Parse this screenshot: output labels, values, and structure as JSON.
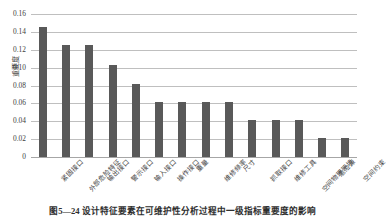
{
  "chart_data": {
    "type": "bar",
    "title": "",
    "xlabel": "",
    "ylabel": "重要度",
    "ylim": [
      0,
      0.16
    ],
    "ytick_labels": [
      "0.16",
      "0.14",
      "0.12",
      "0.10",
      "0.08",
      "0.06",
      "0.04",
      "0.02",
      "0"
    ],
    "ytick_values": [
      0.16,
      0.14,
      0.12,
      0.1,
      0.08,
      0.06,
      0.04,
      0.02,
      0
    ],
    "grid": true,
    "legend": "none",
    "bar_color": "#595959",
    "gridline_color": "#bfbfbf",
    "categories": [
      "紧固接口",
      "外部危险特征",
      "输出接口",
      "警示接口",
      "输入接口",
      "操作接口",
      "重量",
      "维修频率",
      "尺寸",
      "抓取接口",
      "维修工具",
      "空间物理环境",
      "危险源",
      "空间约束"
    ],
    "values": [
      0.146,
      0.125,
      0.125,
      0.103,
      0.082,
      0.062,
      0.062,
      0.062,
      0.062,
      0.041,
      0.041,
      0.041,
      0.021,
      0.021
    ]
  },
  "caption": {
    "text": "图5—24  设计特征要素在可维护性分析过程中一级指标重要度的影响"
  }
}
